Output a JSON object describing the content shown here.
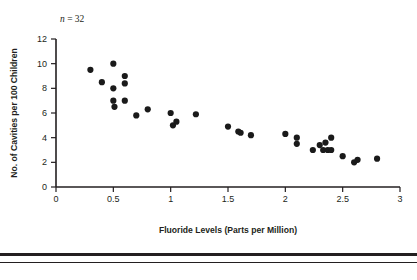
{
  "figure": {
    "annotation_prefix": "n",
    "annotation_value": " = 32",
    "annotation_full": "n = 32",
    "background_color": "#ffffff",
    "point_color": "#1a1a1a",
    "axis_color": "#231f20"
  },
  "chart_data": {
    "type": "scatter",
    "title": "",
    "subtitle": "",
    "xlabel": "Fluoride Levels (Parts per Million)",
    "ylabel": "No. of Cavities per 100 Children",
    "xlim": [
      0,
      3
    ],
    "ylim": [
      0,
      12
    ],
    "xticks": [
      0,
      0.5,
      1,
      1.5,
      2,
      2.5,
      3
    ],
    "xtick_labels": [
      "0",
      "0.5",
      "1",
      "1.5",
      "2",
      "2.5",
      "3"
    ],
    "yticks": [
      0,
      2,
      4,
      6,
      8,
      10,
      12
    ],
    "ytick_labels": [
      "0",
      "2",
      "4",
      "6",
      "8",
      "10",
      "12"
    ],
    "grid": false,
    "legend": false,
    "legend_position": "none",
    "annotations": [
      {
        "text": "n = 32",
        "x": 0.12,
        "y": 12.9
      }
    ],
    "n_points": 32,
    "marker": "circle",
    "marker_size": 3.1,
    "points": [
      {
        "x": 0.3,
        "y": 9.5
      },
      {
        "x": 0.4,
        "y": 8.5
      },
      {
        "x": 0.5,
        "y": 10.0
      },
      {
        "x": 0.5,
        "y": 8.0
      },
      {
        "x": 0.5,
        "y": 7.0
      },
      {
        "x": 0.51,
        "y": 6.5
      },
      {
        "x": 0.6,
        "y": 9.0
      },
      {
        "x": 0.6,
        "y": 8.4
      },
      {
        "x": 0.6,
        "y": 7.0
      },
      {
        "x": 0.7,
        "y": 5.8
      },
      {
        "x": 0.8,
        "y": 6.3
      },
      {
        "x": 1.0,
        "y": 6.0
      },
      {
        "x": 1.02,
        "y": 5.0
      },
      {
        "x": 1.05,
        "y": 5.3
      },
      {
        "x": 1.22,
        "y": 5.9
      },
      {
        "x": 1.5,
        "y": 4.9
      },
      {
        "x": 1.59,
        "y": 4.5
      },
      {
        "x": 1.61,
        "y": 4.4
      },
      {
        "x": 1.7,
        "y": 4.2
      },
      {
        "x": 2.0,
        "y": 4.3
      },
      {
        "x": 2.1,
        "y": 4.0
      },
      {
        "x": 2.1,
        "y": 3.5
      },
      {
        "x": 2.24,
        "y": 3.0
      },
      {
        "x": 2.3,
        "y": 3.4
      },
      {
        "x": 2.33,
        "y": 3.0
      },
      {
        "x": 2.35,
        "y": 3.6
      },
      {
        "x": 2.37,
        "y": 3.0
      },
      {
        "x": 2.4,
        "y": 4.0
      },
      {
        "x": 2.4,
        "y": 3.0
      },
      {
        "x": 2.5,
        "y": 2.5
      },
      {
        "x": 2.6,
        "y": 2.0
      },
      {
        "x": 2.63,
        "y": 2.2
      },
      {
        "x": 2.8,
        "y": 2.3
      }
    ]
  }
}
